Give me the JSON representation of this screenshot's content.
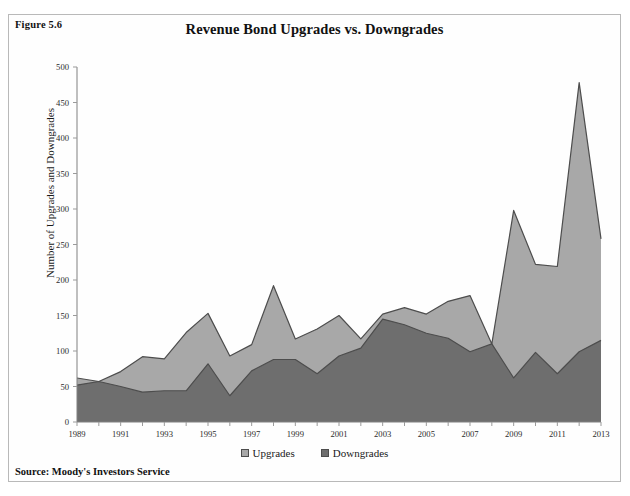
{
  "figure": {
    "number_label": "Figure 5.6",
    "source_note": "Source: Moody's Investors Service"
  },
  "colors": {
    "upgrades_fill": "#a8a8a8",
    "downgrades_fill": "#6e6e6e",
    "series_outline": "#4d4d4d",
    "axis": "#808080",
    "frame_border": "#b9b9b9"
  },
  "chart_data": {
    "type": "area",
    "title": "Revenue Bond Upgrades vs. Downgrades",
    "xlabel": "",
    "ylabel": "Number of Upgrades and Downgrades",
    "ylim": [
      0,
      500
    ],
    "ytick_step": 50,
    "yticks": [
      0,
      50,
      100,
      150,
      200,
      250,
      300,
      350,
      400,
      450,
      500
    ],
    "ytick_labels": [
      "0",
      "50",
      "100",
      "150",
      "200",
      "250",
      "300",
      "350",
      "400",
      "450",
      "500"
    ],
    "x": [
      1989,
      1990,
      1991,
      1992,
      1993,
      1994,
      1995,
      1996,
      1997,
      1998,
      1999,
      2000,
      2001,
      2002,
      2003,
      2004,
      2005,
      2006,
      2007,
      2008,
      2009,
      2010,
      2011,
      2012,
      2013
    ],
    "xtick_values": [
      1989,
      1991,
      1993,
      1995,
      1997,
      1999,
      2001,
      2003,
      2005,
      2007,
      2009,
      2011,
      2013
    ],
    "xtick_labels": [
      "1989",
      "1991",
      "1993",
      "1995",
      "1997",
      "1999",
      "2001",
      "2003",
      "2005",
      "2007",
      "2009",
      "2011",
      "2013"
    ],
    "grid": false,
    "legend_position": "bottom",
    "stacked": false,
    "series": [
      {
        "name": "Upgrades",
        "color": "#a8a8a8",
        "values": [
          62,
          57,
          71,
          92,
          89,
          126,
          153,
          93,
          109,
          192,
          117,
          131,
          150,
          117,
          152,
          161,
          152,
          170,
          178,
          110,
          298,
          222,
          219,
          478,
          258
        ]
      },
      {
        "name": "Downgrades",
        "color": "#6e6e6e",
        "values": [
          52,
          57,
          50,
          42,
          44,
          44,
          82,
          37,
          72,
          88,
          88,
          68,
          93,
          104,
          145,
          137,
          125,
          118,
          99,
          110,
          62,
          98,
          68,
          99,
          115
        ]
      }
    ]
  },
  "legend": {
    "items": [
      {
        "label": "Upgrades"
      },
      {
        "label": "Downgrades"
      }
    ]
  }
}
